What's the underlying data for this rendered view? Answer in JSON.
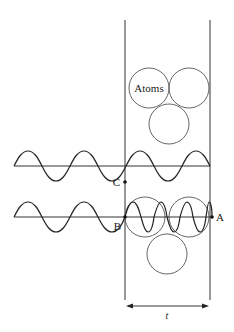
{
  "diagram": {
    "labels": {
      "atoms": "Atoms",
      "point_a": "A",
      "point_b": "B",
      "point_c": "C",
      "width": "t"
    },
    "colors": {
      "stroke": "#333333",
      "wave": "#222222",
      "circle": "#555555",
      "background": "#ffffff"
    },
    "elements": {
      "slab": "vertical slab bounded by two lines",
      "incident_wave_top": "wave passing straight through slab (unchanged wavelength)",
      "incident_wave_bottom": "wave entering slab with shortened wavelength",
      "atoms_top_cluster": 3,
      "atoms_bottom_cluster": 3,
      "dimension_arrow": "double-headed arrow spanning slab width"
    }
  }
}
